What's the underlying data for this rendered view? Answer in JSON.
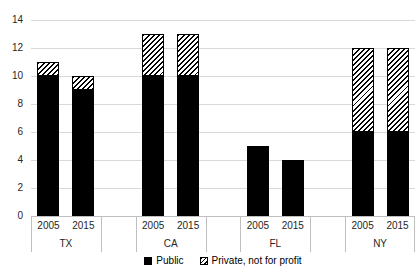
{
  "chart": {
    "background_color": "#ffffff",
    "grid_color": "#d9d9d9",
    "axis_line_color": "#bfbfbf",
    "text_color": "#262626",
    "bar_color": "#000000",
    "hatch_pattern": "black diagonal stripes on white, bottom-left to top-right",
    "legend": {
      "items": [
        {
          "label": "Public",
          "swatch": "solid-black"
        },
        {
          "label": "Private, not for profit",
          "swatch": "diagonal-hatch"
        }
      ]
    }
  },
  "chart_data": {
    "type": "bar",
    "stacked": true,
    "title": "",
    "xlabel": "",
    "ylabel": "",
    "ylim": [
      0,
      14
    ],
    "yticks": [
      0,
      2,
      4,
      6,
      8,
      10,
      12,
      14
    ],
    "grid": true,
    "legend_position": "bottom",
    "groups": [
      {
        "label": "TX",
        "categories": [
          "2005",
          "2015"
        ]
      },
      {
        "label": "CA",
        "categories": [
          "2005",
          "2015"
        ]
      },
      {
        "label": "FL",
        "categories": [
          "2005",
          "2015"
        ]
      },
      {
        "label": "NY",
        "categories": [
          "2005",
          "2015"
        ]
      }
    ],
    "series": [
      {
        "name": "Public",
        "pattern": "solid-black",
        "values": [
          10,
          9,
          10,
          10,
          5,
          4,
          6,
          6
        ]
      },
      {
        "name": "Private, not for profit",
        "pattern": "diagonal-hatch",
        "values": [
          1,
          1,
          3,
          3,
          0,
          0,
          6,
          6
        ]
      }
    ]
  }
}
